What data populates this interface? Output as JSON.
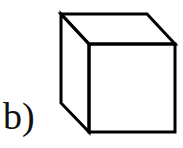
{
  "figure": {
    "label": "b)",
    "shape": "cube",
    "stroke_color": "#000000",
    "background": "#ffffff"
  }
}
